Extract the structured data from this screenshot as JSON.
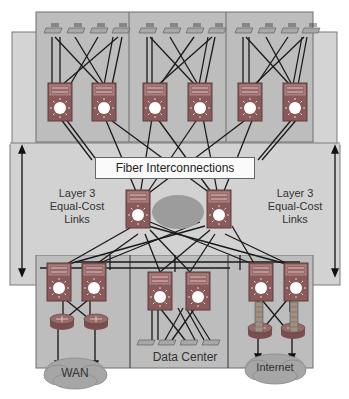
{
  "labels": {
    "fiber_interconnections": "Fiber Interconnections",
    "left_links": [
      "Layer 3",
      "Equal-Cost",
      "Links"
    ],
    "right_links": [
      "Layer 3",
      "Equal-Cost",
      "Links"
    ],
    "data_center": "Data Center",
    "wan": "WAN",
    "internet": "Internet"
  },
  "colors": {
    "panel": "#bdbdbd",
    "panel_border": "#6e6e6e",
    "middle_band": "#d2d2d2",
    "switch": "#8a5a5a",
    "cloud": "#9a9a9a",
    "line": "#1a1a1a"
  },
  "sections": {
    "top_buildings": 3,
    "switches_per_building": 2,
    "access_per_building": 4,
    "core_switches": 2,
    "bottom_blocks": [
      "WAN",
      "Data Center",
      "Internet"
    ]
  }
}
